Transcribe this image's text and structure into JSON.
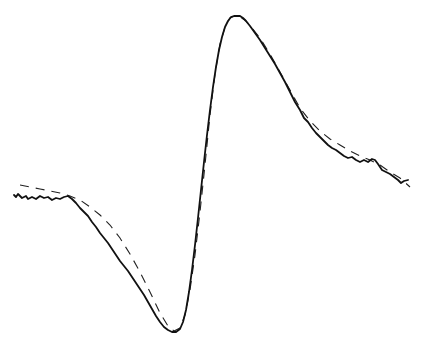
{
  "chart_data": {
    "type": "line",
    "title": "",
    "xlabel": "",
    "ylabel": "",
    "grid": false,
    "legend": null,
    "axes_visible": false,
    "pixel_space": {
      "width": 422,
      "height": 348,
      "y_down": true
    },
    "series": [
      {
        "name": "experimental",
        "style": "solid",
        "color": "#111111",
        "points": [
          [
            14,
            195
          ],
          [
            16,
            197
          ],
          [
            18,
            194
          ],
          [
            22,
            198
          ],
          [
            26,
            196
          ],
          [
            28,
            199
          ],
          [
            32,
            197
          ],
          [
            36,
            199
          ],
          [
            40,
            196
          ],
          [
            44,
            198
          ],
          [
            48,
            197
          ],
          [
            52,
            200
          ],
          [
            56,
            198
          ],
          [
            60,
            199
          ],
          [
            64,
            197
          ],
          [
            68,
            196
          ],
          [
            72,
            199
          ],
          [
            76,
            203
          ],
          [
            80,
            208
          ],
          [
            84,
            212
          ],
          [
            88,
            216
          ],
          [
            92,
            222
          ],
          [
            96,
            227
          ],
          [
            100,
            233
          ],
          [
            104,
            238
          ],
          [
            108,
            243
          ],
          [
            112,
            249
          ],
          [
            116,
            255
          ],
          [
            120,
            261
          ],
          [
            124,
            266
          ],
          [
            128,
            271
          ],
          [
            132,
            277
          ],
          [
            136,
            283
          ],
          [
            140,
            289
          ],
          [
            144,
            295
          ],
          [
            148,
            302
          ],
          [
            152,
            309
          ],
          [
            156,
            316
          ],
          [
            160,
            322
          ],
          [
            164,
            327
          ],
          [
            168,
            330
          ],
          [
            172,
            332
          ],
          [
            176,
            332
          ],
          [
            180,
            329
          ],
          [
            183,
            322
          ],
          [
            186,
            310
          ],
          [
            189,
            292
          ],
          [
            192,
            270
          ],
          [
            195,
            245
          ],
          [
            198,
            218
          ],
          [
            201,
            190
          ],
          [
            204,
            162
          ],
          [
            207,
            135
          ],
          [
            210,
            110
          ],
          [
            213,
            87
          ],
          [
            216,
            67
          ],
          [
            219,
            50
          ],
          [
            222,
            37
          ],
          [
            225,
            27
          ],
          [
            228,
            21
          ],
          [
            231,
            17
          ],
          [
            234,
            16
          ],
          [
            237,
            16
          ],
          [
            240,
            16
          ],
          [
            243,
            18
          ],
          [
            246,
            21
          ],
          [
            250,
            26
          ],
          [
            255,
            33
          ],
          [
            260,
            40
          ],
          [
            265,
            48
          ],
          [
            270,
            56
          ],
          [
            275,
            64
          ],
          [
            280,
            73
          ],
          [
            285,
            82
          ],
          [
            290,
            92
          ],
          [
            295,
            102
          ],
          [
            300,
            110
          ],
          [
            304,
            118
          ],
          [
            308,
            122
          ],
          [
            312,
            128
          ],
          [
            316,
            133
          ],
          [
            320,
            137
          ],
          [
            324,
            141
          ],
          [
            328,
            145
          ],
          [
            332,
            148
          ],
          [
            336,
            150
          ],
          [
            340,
            153
          ],
          [
            344,
            156
          ],
          [
            348,
            158
          ],
          [
            352,
            157
          ],
          [
            356,
            160
          ],
          [
            360,
            162
          ],
          [
            364,
            160
          ],
          [
            368,
            162
          ],
          [
            372,
            159
          ],
          [
            375,
            160
          ],
          [
            378,
            164
          ],
          [
            382,
            170
          ],
          [
            386,
            172
          ],
          [
            390,
            174
          ],
          [
            394,
            177
          ],
          [
            398,
            180
          ],
          [
            401,
            183
          ],
          [
            404,
            181
          ],
          [
            408,
            180
          ]
        ]
      },
      {
        "name": "fit",
        "style": "dashed",
        "color": "#222222",
        "points": [
          [
            20,
            185
          ],
          [
            30,
            187
          ],
          [
            40,
            189
          ],
          [
            50,
            191
          ],
          [
            60,
            193
          ],
          [
            70,
            196
          ],
          [
            80,
            200
          ],
          [
            90,
            207
          ],
          [
            100,
            215
          ],
          [
            110,
            225
          ],
          [
            120,
            238
          ],
          [
            130,
            254
          ],
          [
            140,
            272
          ],
          [
            150,
            292
          ],
          [
            160,
            313
          ],
          [
            168,
            326
          ],
          [
            174,
            331
          ],
          [
            180,
            328
          ],
          [
            185,
            315
          ],
          [
            190,
            290
          ],
          [
            195,
            255
          ],
          [
            200,
            212
          ],
          [
            205,
            165
          ],
          [
            210,
            115
          ],
          [
            215,
            74
          ],
          [
            220,
            44
          ],
          [
            225,
            27
          ],
          [
            230,
            18
          ],
          [
            235,
            16
          ],
          [
            240,
            17
          ],
          [
            245,
            20
          ],
          [
            252,
            28
          ],
          [
            260,
            38
          ],
          [
            270,
            54
          ],
          [
            280,
            72
          ],
          [
            290,
            90
          ],
          [
            300,
            108
          ],
          [
            310,
            121
          ],
          [
            320,
            131
          ],
          [
            330,
            139
          ],
          [
            340,
            145
          ],
          [
            350,
            151
          ],
          [
            360,
            156
          ],
          [
            370,
            160
          ],
          [
            380,
            165
          ],
          [
            390,
            172
          ],
          [
            400,
            178
          ],
          [
            410,
            187
          ]
        ]
      }
    ],
    "extrema": {
      "minimum": {
        "x_px": 174,
        "y_px": 332
      },
      "maximum": {
        "x_px": 236,
        "y_px": 16
      }
    }
  }
}
